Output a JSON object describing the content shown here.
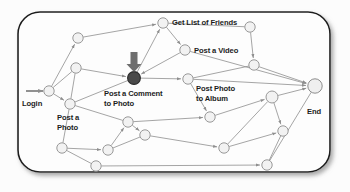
{
  "diagram": {
    "card": {
      "x": 18,
      "y": 12,
      "w": 312,
      "h": 160,
      "radius": 22,
      "fill": "#fdfdfd",
      "border": "#1f1f1f",
      "shadow": "#9a9a9a"
    },
    "colors": {
      "node_fill": "#f2f2f2",
      "node_stroke": "#8d8d8d",
      "highlight_node_fill": "#4a4a4a",
      "highlight_node_stroke": "#2a2a2a",
      "end_node_fill": "#efefef",
      "edge": "#8e8e8e",
      "pointer_arrow": "#6e6e6e",
      "text": "#1c1c1c"
    },
    "labels": [
      {
        "name": "login",
        "text": "Login",
        "x": 22,
        "y": 99,
        "size": 7.6
      },
      {
        "name": "post-a-photo",
        "text": "Post a\nPhoto",
        "x": 57,
        "y": 113,
        "size": 7.6
      },
      {
        "name": "post-a-comment-to-photo",
        "text": "Post a Comment\nto Photo",
        "x": 104,
        "y": 89,
        "size": 7.6
      },
      {
        "name": "get-list-of-friends",
        "text": "Get List of Friends",
        "x": 172,
        "y": 18,
        "size": 7.6
      },
      {
        "name": "post-a-video",
        "text": "Post a Video",
        "x": 194,
        "y": 46,
        "size": 7.6
      },
      {
        "name": "post-photo-to-album",
        "text": "Post Photo\nto Album",
        "x": 196,
        "y": 84,
        "size": 7.6
      },
      {
        "name": "end",
        "text": "End",
        "x": 307,
        "y": 107,
        "size": 7.6
      }
    ],
    "nodes": [
      {
        "id": "n_login",
        "name": "node-login",
        "x": 49,
        "y": 91,
        "r": 5.2,
        "kind": "plain"
      },
      {
        "id": "n_photo",
        "name": "node-post-a-photo",
        "x": 70,
        "y": 104,
        "r": 5.2,
        "kind": "plain"
      },
      {
        "id": "n_a",
        "name": "node-upper-left",
        "x": 78,
        "y": 38,
        "r": 5.2,
        "kind": "plain"
      },
      {
        "id": "n_b",
        "name": "node-mid-left",
        "x": 76,
        "y": 68,
        "r": 5.2,
        "kind": "plain"
      },
      {
        "id": "n_friends",
        "name": "node-get-list-of-friends",
        "x": 163,
        "y": 23,
        "r": 5.2,
        "kind": "plain"
      },
      {
        "id": "n_video",
        "name": "node-post-a-video",
        "x": 185,
        "y": 50,
        "r": 5.2,
        "kind": "plain"
      },
      {
        "id": "n_comment",
        "name": "node-post-a-comment-to-photo",
        "x": 134,
        "y": 78,
        "r": 6.4,
        "kind": "highlight"
      },
      {
        "id": "n_album",
        "name": "node-post-photo-to-album",
        "x": 188,
        "y": 79,
        "r": 5.2,
        "kind": "plain"
      },
      {
        "id": "n_topright",
        "name": "node-top-right",
        "x": 250,
        "y": 27,
        "r": 5.2,
        "kind": "plain"
      },
      {
        "id": "n_right1",
        "name": "node-right-upper",
        "x": 254,
        "y": 65,
        "r": 5.2,
        "kind": "plain"
      },
      {
        "id": "n_end",
        "name": "node-end",
        "x": 315,
        "y": 86,
        "r": 7.2,
        "kind": "end"
      },
      {
        "id": "n_c",
        "name": "node-center-lower",
        "x": 128,
        "y": 122,
        "r": 5.2,
        "kind": "plain"
      },
      {
        "id": "n_d",
        "name": "node-center-lower-2",
        "x": 145,
        "y": 135,
        "r": 5.2,
        "kind": "plain"
      },
      {
        "id": "n_e",
        "name": "node-mid-lower-right",
        "x": 210,
        "y": 117,
        "r": 5.2,
        "kind": "plain"
      },
      {
        "id": "n_f",
        "name": "node-lower-left",
        "x": 62,
        "y": 148,
        "r": 5.2,
        "kind": "plain"
      },
      {
        "id": "n_g",
        "name": "node-lower-left-2",
        "x": 108,
        "y": 150,
        "r": 5.2,
        "kind": "plain"
      },
      {
        "id": "n_h",
        "name": "node-bottom-left",
        "x": 96,
        "y": 166,
        "r": 5.2,
        "kind": "plain"
      },
      {
        "id": "n_i",
        "name": "node-right-cluster",
        "x": 272,
        "y": 97,
        "r": 6.0,
        "kind": "plain"
      },
      {
        "id": "n_j",
        "name": "node-right-cluster-2",
        "x": 283,
        "y": 131,
        "r": 5.2,
        "kind": "plain"
      },
      {
        "id": "n_k",
        "name": "node-bottom-center",
        "x": 224,
        "y": 148,
        "r": 5.2,
        "kind": "plain"
      },
      {
        "id": "n_l",
        "name": "node-bottom-right",
        "x": 267,
        "y": 165,
        "r": 5.2,
        "kind": "plain"
      }
    ],
    "edges": [
      {
        "from": "n_login",
        "to": "n_a",
        "arrow": true
      },
      {
        "from": "n_login",
        "to": "n_b",
        "arrow": false
      },
      {
        "from": "n_login",
        "to": "n_photo",
        "arrow": true
      },
      {
        "from": "n_a",
        "to": "n_friends",
        "arrow": true
      },
      {
        "from": "n_b",
        "to": "n_comment",
        "arrow": true
      },
      {
        "from": "n_b",
        "to": "n_photo",
        "arrow": false
      },
      {
        "from": "n_photo",
        "to": "n_comment",
        "arrow": false
      },
      {
        "from": "n_comment",
        "to": "n_friends",
        "arrow": true
      },
      {
        "from": "n_friends",
        "to": "n_video",
        "arrow": true
      },
      {
        "from": "n_video",
        "to": "n_comment",
        "arrow": true
      },
      {
        "from": "n_comment",
        "to": "n_album",
        "arrow": true
      },
      {
        "from": "n_friends",
        "to": "n_topright",
        "arrow": false
      },
      {
        "from": "n_topright",
        "to": "n_right1",
        "arrow": true
      },
      {
        "from": "n_video",
        "to": "n_end",
        "arrow": true
      },
      {
        "from": "n_right1",
        "to": "n_end",
        "arrow": true
      },
      {
        "from": "n_right1",
        "to": "n_album",
        "arrow": false
      },
      {
        "from": "n_album",
        "to": "n_e",
        "arrow": true
      },
      {
        "from": "n_photo",
        "to": "n_f",
        "arrow": false
      },
      {
        "from": "n_photo",
        "to": "n_c",
        "arrow": false
      },
      {
        "from": "n_c",
        "to": "n_d",
        "arrow": true
      },
      {
        "from": "n_c",
        "to": "n_e",
        "arrow": true
      },
      {
        "from": "n_d",
        "to": "n_k",
        "arrow": true
      },
      {
        "from": "n_f",
        "to": "n_g",
        "arrow": true
      },
      {
        "from": "n_f",
        "to": "n_h",
        "arrow": false
      },
      {
        "from": "n_g",
        "to": "n_c",
        "arrow": true
      },
      {
        "from": "n_h",
        "to": "n_l",
        "arrow": true
      },
      {
        "from": "n_e",
        "to": "n_i",
        "arrow": true
      },
      {
        "from": "n_i",
        "to": "n_end",
        "arrow": true
      },
      {
        "from": "n_i",
        "to": "n_j",
        "arrow": true
      },
      {
        "from": "n_i",
        "to": "n_k",
        "arrow": false
      },
      {
        "from": "n_j",
        "to": "n_l",
        "arrow": false
      },
      {
        "from": "n_k",
        "to": "n_j",
        "arrow": true
      },
      {
        "from": "n_l",
        "to": "n_end",
        "arrow": false
      },
      {
        "from": "n_album",
        "to": "n_end",
        "arrow": true
      },
      {
        "from": "n_d",
        "to": "n_g",
        "arrow": false
      }
    ],
    "entry_arrow": {
      "name": "login-entry-arrow",
      "x1": 26,
      "y1": 91,
      "x2": 43,
      "y2": 91
    },
    "pointer": {
      "name": "highlight-pointer-arrow",
      "x": 134,
      "y_top": 52,
      "y_tip": 72,
      "shaft_w": 7,
      "head_w": 15
    }
  }
}
